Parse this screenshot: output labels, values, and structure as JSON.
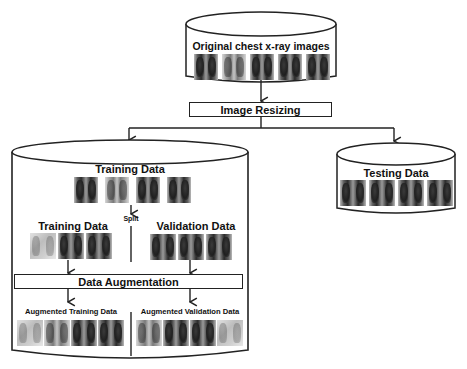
{
  "diagram": {
    "source": {
      "label": "Original chest x-ray images",
      "thumbnail_count": 5
    },
    "resize_step": {
      "label": "Image Resizing"
    },
    "training_store": {
      "label": "Training Data",
      "thumbnail_count": 4,
      "split_label": "Split",
      "train_subset": {
        "label": "Training Data",
        "thumbnail_count": 3
      },
      "validation_subset": {
        "label": "Validation Data",
        "thumbnail_count": 3
      },
      "augmentation_step": {
        "label": "Data Augmentation"
      },
      "augmented_train": {
        "label": "Augmented Training Data",
        "thumbnail_count": 4
      },
      "augmented_validation": {
        "label": "Augmented Validation Data",
        "thumbnail_count": 4
      }
    },
    "testing_store": {
      "label": "Testing Data",
      "thumbnail_count": 4
    },
    "colors": {
      "stroke": "#222222",
      "background": "#ffffff",
      "text": "#111111"
    }
  }
}
